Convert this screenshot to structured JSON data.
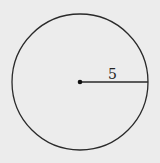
{
  "diagram": {
    "shape": "circle",
    "radius_label": "5",
    "colors": {
      "background": "#ececec",
      "stroke": "#2a2a2a"
    }
  }
}
